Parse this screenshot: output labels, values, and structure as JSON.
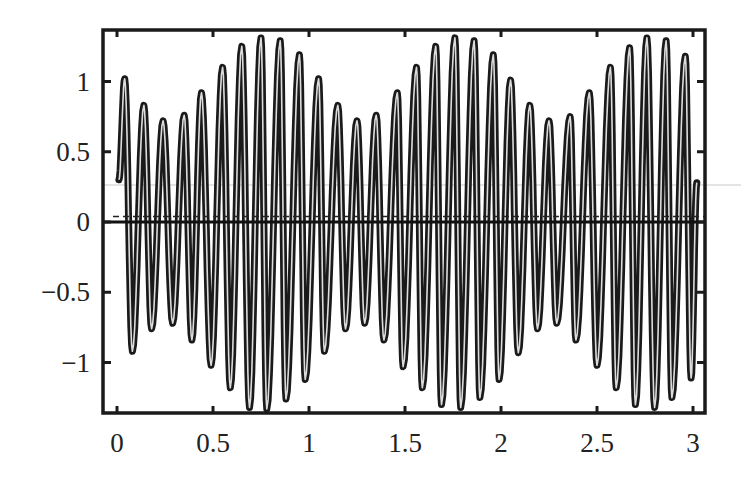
{
  "chart_data": {
    "type": "line",
    "title": "",
    "xlabel": "",
    "ylabel": "",
    "xlim": [
      -0.08,
      3.07
    ],
    "ylim": [
      -1.37,
      1.37
    ],
    "x_ticks": [
      0,
      0.5,
      1,
      1.5,
      2,
      2.5,
      3
    ],
    "x_tick_labels": [
      "0",
      "0.5",
      "1",
      "1.5",
      "2",
      "2.5",
      "3"
    ],
    "y_ticks": [
      1,
      0.5,
      0,
      -0.5,
      -1
    ],
    "y_tick_labels": [
      "1",
      "0.5",
      "0",
      "−0.5",
      "−1"
    ],
    "grid": false,
    "legend": null,
    "series": [
      {
        "name": "amplitude-modulated oscillation",
        "description": "~10 Hz oscillation with beat envelope of period 1; envelope min ~0.72 near t=0.25, 1.25, 2.25; max ~1.32 near t=0.78, 1.78, 2.78",
        "carrier_frequency": 10,
        "envelope_mean": 1.02,
        "envelope_depth": 0.3,
        "envelope_period": 1.0,
        "envelope_peak_t": 0.78,
        "t_start": 0.01,
        "t_end": 3.02,
        "peaks": [
          {
            "x": 0.04,
            "y": 1.02
          },
          {
            "x": 0.14,
            "y": 0.83
          },
          {
            "x": 0.24,
            "y": 0.72
          },
          {
            "x": 0.35,
            "y": 0.76
          },
          {
            "x": 0.44,
            "y": 0.92
          },
          {
            "x": 0.55,
            "y": 1.1
          },
          {
            "x": 0.65,
            "y": 1.25
          },
          {
            "x": 0.75,
            "y": 1.31
          },
          {
            "x": 0.85,
            "y": 1.29
          },
          {
            "x": 0.95,
            "y": 1.19
          },
          {
            "x": 1.05,
            "y": 1.02
          },
          {
            "x": 1.15,
            "y": 0.83
          },
          {
            "x": 1.25,
            "y": 0.72
          },
          {
            "x": 1.35,
            "y": 0.76
          },
          {
            "x": 1.46,
            "y": 0.92
          },
          {
            "x": 1.56,
            "y": 1.1
          },
          {
            "x": 1.66,
            "y": 1.25
          },
          {
            "x": 1.76,
            "y": 1.31
          },
          {
            "x": 1.86,
            "y": 1.29
          },
          {
            "x": 1.96,
            "y": 1.19
          },
          {
            "x": 2.05,
            "y": 1.01
          },
          {
            "x": 2.15,
            "y": 0.83
          },
          {
            "x": 2.25,
            "y": 0.72
          },
          {
            "x": 2.36,
            "y": 0.75
          },
          {
            "x": 2.46,
            "y": 0.92
          },
          {
            "x": 2.57,
            "y": 1.1
          },
          {
            "x": 2.67,
            "y": 1.24
          },
          {
            "x": 2.76,
            "y": 1.31
          },
          {
            "x": 2.86,
            "y": 1.29
          },
          {
            "x": 2.96,
            "y": 1.18
          }
        ],
        "troughs": [
          {
            "x": 0.08,
            "y": -0.92
          },
          {
            "x": 0.18,
            "y": -0.76
          },
          {
            "x": 0.29,
            "y": -0.72
          },
          {
            "x": 0.39,
            "y": -0.84
          },
          {
            "x": 0.49,
            "y": -1.02
          },
          {
            "x": 0.59,
            "y": -1.18
          },
          {
            "x": 0.69,
            "y": -1.32
          },
          {
            "x": 0.78,
            "y": -1.33
          },
          {
            "x": 0.88,
            "y": -1.26
          },
          {
            "x": 0.98,
            "y": -1.12
          },
          {
            "x": 1.08,
            "y": -0.92
          },
          {
            "x": 1.19,
            "y": -0.76
          },
          {
            "x": 1.29,
            "y": -0.72
          },
          {
            "x": 1.39,
            "y": -0.84
          },
          {
            "x": 1.49,
            "y": -1.03
          },
          {
            "x": 1.59,
            "y": -1.18
          },
          {
            "x": 1.69,
            "y": -1.3
          },
          {
            "x": 1.79,
            "y": -1.32
          },
          {
            "x": 1.89,
            "y": -1.25
          },
          {
            "x": 1.99,
            "y": -1.12
          },
          {
            "x": 2.09,
            "y": -0.93
          },
          {
            "x": 2.19,
            "y": -0.76
          },
          {
            "x": 2.29,
            "y": -0.72
          },
          {
            "x": 2.39,
            "y": -0.84
          },
          {
            "x": 2.5,
            "y": -1.02
          },
          {
            "x": 2.6,
            "y": -1.18
          },
          {
            "x": 2.7,
            "y": -1.3
          },
          {
            "x": 2.8,
            "y": -1.32
          },
          {
            "x": 2.89,
            "y": -1.25
          },
          {
            "x": 2.99,
            "y": -1.11
          }
        ],
        "color": "#1a1a1a"
      }
    ],
    "reference_lines": [
      {
        "name": "zero-line",
        "y": 0.0,
        "style": "solid",
        "color": "#111111"
      },
      {
        "name": "offset-line",
        "y": 0.04,
        "style": "dashed",
        "color": "#222222"
      }
    ]
  },
  "layout": {
    "plot_left_px": 103,
    "plot_right_px": 705,
    "plot_top_px": 30,
    "plot_bottom_px": 413,
    "x0_px": 117,
    "px_per_x_unit": 192,
    "y0_px": 222,
    "px_per_y_unit": 140.5
  }
}
